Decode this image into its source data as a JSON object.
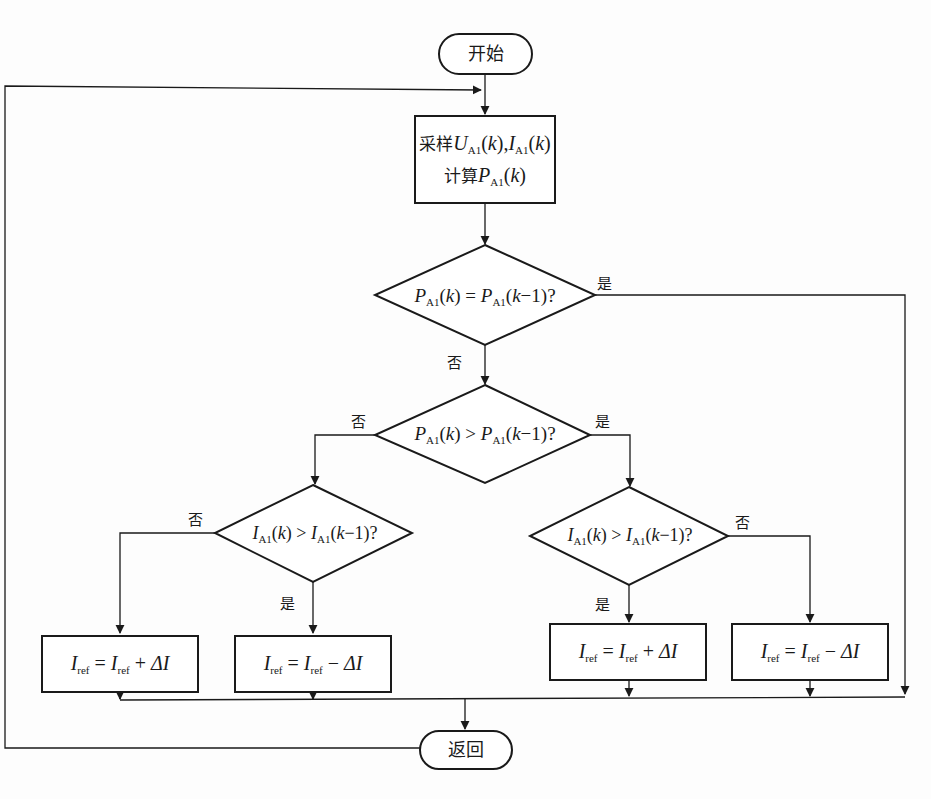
{
  "flowchart": {
    "start": {
      "label": "开始"
    },
    "end": {
      "label": "返回"
    },
    "process": {
      "line1_prefix": "采样",
      "line1_math": "U_A1(k), I_A1(k)",
      "line2_prefix": "计算",
      "line2_math": "P_A1(k)"
    },
    "decisions": [
      {
        "id": "d1",
        "text": "P_A1(k) = P_A1(k−1)?",
        "yes": "是",
        "no": "否"
      },
      {
        "id": "d2",
        "text": "P_A1(k) > P_A1(k−1)?",
        "yes": "是",
        "no": "否"
      },
      {
        "id": "d3",
        "text": "I_A1(k) > I_A1(k−1)?",
        "yes": "是",
        "no": "否"
      },
      {
        "id": "d4",
        "text": "I_A1(k) > I_A1(k−1)?",
        "yes": "是",
        "no": "否"
      }
    ],
    "actions": [
      {
        "id": "a1",
        "text": "I_ref = I_ref + ΔI",
        "op": "+"
      },
      {
        "id": "a2",
        "text": "I_ref = I_ref − ΔI",
        "op": "−"
      },
      {
        "id": "a3",
        "text": "I_ref = I_ref + ΔI",
        "op": "+"
      },
      {
        "id": "a4",
        "text": "I_ref = I_ref − ΔI",
        "op": "−"
      }
    ],
    "symbols": {
      "P": "P",
      "U": "U",
      "I": "I",
      "k": "k",
      "sub_A1": "A1",
      "sub_ref": "ref",
      "eq": "=",
      "gt": ">",
      "minus1": "−1)?",
      "plus": "+",
      "minus": "−",
      "delta": "ΔI",
      "comma": ","
    }
  },
  "colors": {
    "stroke": "#1a1a1a",
    "background": "#fdfdfd"
  }
}
